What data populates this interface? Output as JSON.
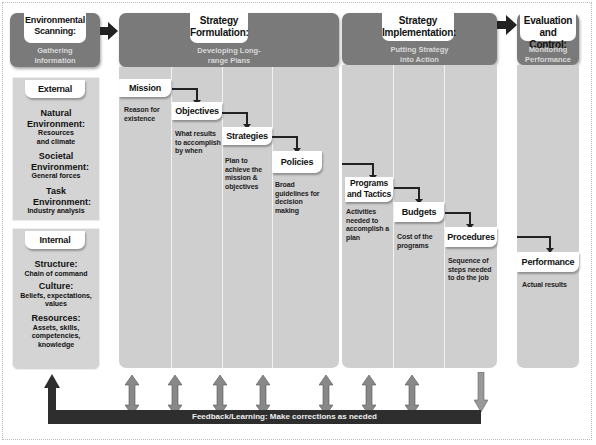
{
  "phases": [
    {
      "title": "Environmental Scanning:",
      "subtitle": "Gathering Information"
    },
    {
      "title": "Strategy Formulation:",
      "subtitle": "Developing Long-range Plans"
    },
    {
      "title": "Strategy Implementation:",
      "subtitle": "Putting Strategy into Action"
    },
    {
      "title": "Evaluation and Control:",
      "subtitle": "Monitoring Performance"
    }
  ],
  "scanning": {
    "external": {
      "label": "External",
      "items": [
        {
          "heading": "Natural Environment:",
          "detail": "Resources and climate"
        },
        {
          "heading": "Societal Environment:",
          "detail": "General forces"
        },
        {
          "heading": "Task Environment:",
          "detail": "Industry analysis"
        }
      ]
    },
    "internal": {
      "label": "Internal",
      "items": [
        {
          "heading": "Structure:",
          "detail": "Chain of command"
        },
        {
          "heading": "Culture:",
          "detail": "Beliefs, expectations, values"
        },
        {
          "heading": "Resources:",
          "detail": "Assets, skills, competencies, knowledge"
        }
      ]
    }
  },
  "formulation": [
    {
      "label": "Mission",
      "desc": "Reason for existence"
    },
    {
      "label": "Objectives",
      "desc": "What results to accomplish by when"
    },
    {
      "label": "Strategies",
      "desc": "Plan to achieve the mission & objectives"
    },
    {
      "label": "Policies",
      "desc": "Broad guidelines for decision making"
    }
  ],
  "implementation": [
    {
      "label": "Programs and Tactics",
      "desc": "Activities needed to accomplish a plan"
    },
    {
      "label": "Budgets",
      "desc": "Cost of the programs"
    },
    {
      "label": "Procedures",
      "desc": "Sequence of steps needed to do the job"
    }
  ],
  "evaluation": {
    "label": "Performance",
    "desc": "Actual results"
  },
  "feedback": {
    "label": "Feedback/Learning: Make corrections as needed"
  },
  "colors": {
    "header": "#7a7a7a",
    "column": "#cfcfcf",
    "arrow": "#222222",
    "feedback_bar": "#2e2e2e"
  }
}
